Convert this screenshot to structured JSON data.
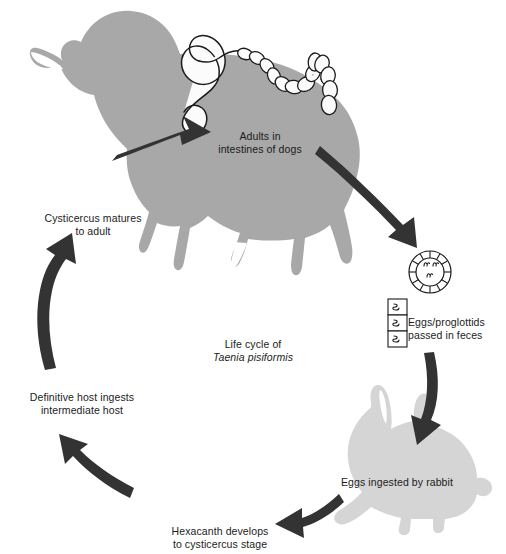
{
  "figure": {
    "caption_line1": "Life cycle of",
    "caption_line2": "Taenia pisiformis",
    "background_color": "#ffffff",
    "dog_color": "#a8a8a8",
    "rabbit_color": "#d5d5d5",
    "arrow_color": "#333333",
    "text_color": "#1b1b1b",
    "worm_fill": "#fbfbfb",
    "worm_outline": "#1b1b1b"
  },
  "stages": {
    "adults": {
      "line1": "Adults in",
      "line2": "intestines of dogs"
    },
    "eggs_passed": {
      "line1": "Eggs/proglottids",
      "line2": "passed in feces"
    },
    "eggs_ingested": {
      "line1": "Eggs ingested by rabbit"
    },
    "hexacanth": {
      "line1": "Hexacanth develops",
      "line2": "to cysticercus stage"
    },
    "definitive_host": {
      "line1": "Definitive host ingests",
      "line2": "intermediate host"
    },
    "cysticercus": {
      "line1": "Cysticercus matures",
      "line2": "to adult"
    }
  },
  "icons": {
    "dog": "dog-silhouette-icon",
    "rabbit": "rabbit-silhouette-icon",
    "tapeworm": "tapeworm-icon",
    "egg": "taenia-egg-icon",
    "proglottids": "proglottid-chain-icon",
    "arrows": [
      "arrow-cysticercus-to-adult",
      "arrow-adult-to-eggs",
      "arrow-eggs-to-rabbit",
      "arrow-rabbit-to-hexacanth",
      "arrow-hexacanth-to-definitive-host"
    ]
  }
}
